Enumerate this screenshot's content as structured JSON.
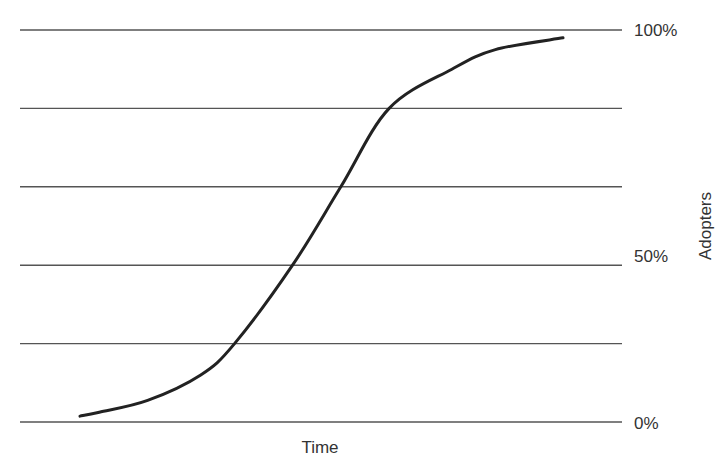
{
  "chart_data": {
    "type": "line",
    "title": "",
    "xlabel": "Time",
    "ylabel": "Adopters",
    "ylim": [
      0,
      100
    ],
    "y_ticks": [
      0,
      50,
      100
    ],
    "y_tick_labels": [
      "0%",
      "50%",
      "100%"
    ],
    "gridlines": [
      0,
      20,
      40,
      60,
      80,
      100
    ],
    "grid": true,
    "y_axis_position": "right",
    "legend": null,
    "series": [
      {
        "name": "Adoption S-curve",
        "x": [
          0,
          4,
          14,
          25,
          32,
          44,
          54,
          64,
          77,
          86,
          100
        ],
        "values": [
          1.5,
          2.5,
          5.5,
          12,
          20,
          40,
          60,
          80,
          90,
          95,
          98
        ]
      }
    ]
  },
  "labels": {
    "y100": "100%",
    "y50": "50%",
    "y0": "0%",
    "xlabel": "Time",
    "ylabel": "Adopters"
  },
  "colors": {
    "curve": "#222222",
    "grid": "#555555",
    "text": "#333333"
  }
}
